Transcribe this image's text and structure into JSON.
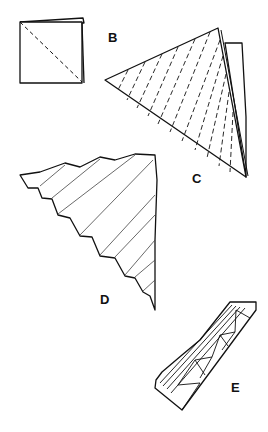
{
  "diagram": {
    "steps": [
      {
        "label": "B",
        "description": "square folded, diagonal crease dashed"
      },
      {
        "label": "C",
        "description": "triangle with dashed pleat lines"
      },
      {
        "label": "D",
        "description": "pleated stepped triangle"
      },
      {
        "label": "E",
        "description": "collapsed pleated strip"
      }
    ]
  }
}
